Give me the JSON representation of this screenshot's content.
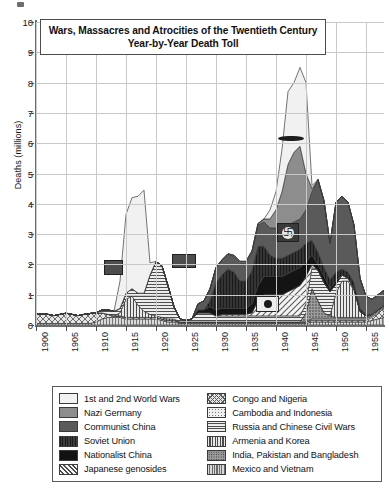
{
  "title_box": {
    "line1": "Wars, Massacres and Atrocities of the Twentieth Century",
    "line2": "Year-by-Year Death Toll"
  },
  "axis": {
    "ylabel": "Deaths (millions)",
    "yticks": [
      "0",
      "1",
      "2",
      "3",
      "4",
      "5",
      "6",
      "7",
      "8",
      "9",
      "10"
    ],
    "xticks": [
      "1900",
      "1905",
      "1910",
      "1915",
      "1920",
      "1925",
      "1930",
      "1935",
      "1940",
      "1945",
      "1950",
      "1955"
    ]
  },
  "legend": {
    "left": [
      {
        "label": "1st and 2nd World Wars",
        "fill": "f-white",
        "color": "#f2f2f2"
      },
      {
        "label": "Nazi Germany",
        "fill": "f-midgray",
        "color": "#8d8d8d"
      },
      {
        "label": "Communist China",
        "fill": "f-darkgray",
        "color": "#5a5a5a"
      },
      {
        "label": "Soviet Union",
        "fill": "f-soviet",
        "color": "#333333"
      },
      {
        "label": "Nationalist China",
        "fill": "f-black",
        "color": "#121212"
      },
      {
        "label": "Japanese genosides",
        "fill": "f-jap",
        "color": "#f4f4f4"
      }
    ],
    "right": [
      {
        "label": "Congo and Nigeria",
        "fill": "f-congo",
        "color": "#e4e4e4"
      },
      {
        "label": "Cambodia and Indonesia",
        "fill": "f-cambodia",
        "color": "#f0f0f0"
      },
      {
        "label": "Russia and Chinese Civil Wars",
        "fill": "f-russia",
        "color": "#ededed"
      },
      {
        "label": "Armenia and Korea",
        "fill": "f-armenia",
        "color": "#e8e8e8"
      },
      {
        "label": "India, Pakistan and Bangladesh",
        "fill": "f-india",
        "color": "#9a9a9a"
      },
      {
        "label": "Mexico and Vietnam",
        "fill": "f-mexico",
        "color": "#d8d8d8"
      }
    ]
  },
  "insets": [
    {
      "name": "battleship-photo",
      "desc": "dark ship silhouette over World Wars band"
    },
    {
      "name": "swastika-flag-photo",
      "desc": "swastika emblem over Nazi Germany band"
    },
    {
      "name": "rising-sun-flag-photo",
      "desc": "flag emblem over Japanese genosides band"
    },
    {
      "name": "archive-photo-small",
      "desc": "small photo over Soviet Union band"
    },
    {
      "name": "archive-photo-small-2",
      "desc": "small photo over Nationalist China band"
    }
  ],
  "chart_data": {
    "type": "area",
    "stacked": true,
    "xlabel": "",
    "ylabel": "Deaths (millions)",
    "xlim": [
      1900,
      1958
    ],
    "ylim": [
      0,
      10
    ],
    "grid": true,
    "legend_position": "below-plot",
    "x": [
      1900,
      1901,
      1902,
      1903,
      1904,
      1905,
      1906,
      1907,
      1908,
      1909,
      1910,
      1911,
      1912,
      1913,
      1914,
      1915,
      1916,
      1917,
      1918,
      1919,
      1920,
      1921,
      1922,
      1923,
      1924,
      1925,
      1926,
      1927,
      1928,
      1929,
      1930,
      1931,
      1932,
      1933,
      1934,
      1935,
      1936,
      1937,
      1938,
      1939,
      1940,
      1941,
      1942,
      1943,
      1944,
      1945,
      1946,
      1947,
      1948,
      1949,
      1950,
      1951,
      1952,
      1953,
      1954,
      1955,
      1956,
      1957,
      1958
    ],
    "series": [
      {
        "name": "1st and 2nd World Wars",
        "fill": "#f2f2f2",
        "values": [
          0,
          0,
          0,
          0,
          0,
          0,
          0,
          0,
          0,
          0,
          0,
          0,
          0,
          0,
          0.9,
          2.6,
          3.0,
          3.2,
          3.4,
          0.4,
          0,
          0,
          0,
          0,
          0,
          0,
          0,
          0,
          0,
          0,
          0,
          0,
          0,
          0,
          0,
          0,
          0,
          0,
          0,
          0.3,
          0.6,
          1.4,
          2.4,
          2.3,
          2.6,
          3.0,
          0.1,
          0,
          0,
          0,
          0,
          0,
          0,
          0,
          0,
          0,
          0,
          0,
          0
        ]
      },
      {
        "name": "Nazi Germany",
        "fill": "#8d8d8d",
        "values": [
          0,
          0,
          0,
          0,
          0,
          0,
          0,
          0,
          0,
          0,
          0,
          0,
          0,
          0,
          0,
          0,
          0,
          0,
          0,
          0,
          0,
          0,
          0,
          0,
          0,
          0,
          0,
          0,
          0,
          0,
          0,
          0,
          0,
          0.05,
          0.05,
          0.05,
          0.05,
          0.05,
          0.1,
          0.3,
          0.6,
          1.2,
          2.0,
          2.3,
          2.4,
          1.2,
          0.1,
          0,
          0,
          0,
          0,
          0,
          0,
          0,
          0,
          0,
          0,
          0,
          0
        ]
      },
      {
        "name": "Communist China",
        "fill": "#5a5a5a",
        "values": [
          0,
          0,
          0,
          0,
          0,
          0,
          0,
          0,
          0,
          0,
          0,
          0,
          0,
          0,
          0,
          0,
          0,
          0,
          0,
          0,
          0,
          0,
          0,
          0,
          0,
          0,
          0,
          0.2,
          0.3,
          0.4,
          0.5,
          0.5,
          0.5,
          0.5,
          0.6,
          0.6,
          0.6,
          0.7,
          0.8,
          0.9,
          1.0,
          1.0,
          1.0,
          1.0,
          1.0,
          1.1,
          1.6,
          2.4,
          2.2,
          1.2,
          2.3,
          2.4,
          2.3,
          1.9,
          1.0,
          0.6,
          0.5,
          0.5,
          0.5
        ]
      },
      {
        "name": "Soviet Union",
        "fill": "#333333",
        "values": [
          0,
          0,
          0,
          0,
          0,
          0,
          0,
          0,
          0,
          0,
          0,
          0,
          0,
          0,
          0,
          0,
          0,
          0,
          0,
          0,
          0,
          0,
          0,
          0,
          0,
          0,
          0,
          0,
          0,
          0.2,
          0.9,
          1.1,
          1.3,
          1.2,
          0.9,
          0.9,
          1.1,
          1.3,
          1.0,
          0.7,
          0.6,
          0.6,
          0.6,
          0.6,
          0.6,
          0.6,
          0.5,
          0.4,
          0.3,
          0.3,
          0.3,
          0.2,
          0.2,
          0.2,
          0.1,
          0.05,
          0,
          0,
          0
        ]
      },
      {
        "name": "Nationalist China",
        "fill": "#121212",
        "values": [
          0,
          0,
          0,
          0,
          0,
          0,
          0,
          0,
          0,
          0,
          0,
          0,
          0,
          0,
          0,
          0,
          0,
          0,
          0,
          0,
          0,
          0,
          0,
          0,
          0,
          0,
          0,
          0.1,
          0.1,
          0.2,
          0.2,
          0.2,
          0.2,
          0.2,
          0.2,
          0.2,
          0.3,
          0.5,
          0.6,
          0.6,
          0.6,
          0.6,
          0.6,
          0.6,
          0.6,
          0.5,
          0.3,
          0.2,
          0.2,
          0.1,
          0.1,
          0,
          0,
          0,
          0,
          0,
          0,
          0,
          0
        ]
      },
      {
        "name": "Japanese genosides",
        "fill": "#f4f4f4",
        "values": [
          0,
          0,
          0,
          0,
          0,
          0,
          0,
          0,
          0,
          0,
          0,
          0,
          0,
          0,
          0,
          0,
          0,
          0,
          0,
          0,
          0,
          0,
          0,
          0,
          0,
          0,
          0,
          0,
          0,
          0,
          0,
          0.05,
          0.05,
          0.05,
          0.05,
          0.05,
          0.1,
          0.5,
          0.7,
          0.7,
          0.7,
          0.7,
          0.8,
          0.9,
          1.0,
          0.9,
          0.1,
          0,
          0,
          0,
          0,
          0,
          0,
          0,
          0,
          0,
          0,
          0,
          0
        ]
      },
      {
        "name": "Congo and Nigeria",
        "fill": "#e4e4e4",
        "values": [
          0.3,
          0.32,
          0.3,
          0.26,
          0.3,
          0.34,
          0.3,
          0.26,
          0.3,
          0.33,
          0.3,
          0.2,
          0.1,
          0.05,
          0.05,
          0.05,
          0.05,
          0.05,
          0.05,
          0.05,
          0.05,
          0.05,
          0.05,
          0.05,
          0.05,
          0.05,
          0.05,
          0.05,
          0.05,
          0.05,
          0.05,
          0.05,
          0.05,
          0.05,
          0.05,
          0.05,
          0.05,
          0.05,
          0.05,
          0.05,
          0.05,
          0.05,
          0.05,
          0.05,
          0.05,
          0.05,
          0.05,
          0.05,
          0.05,
          0.05,
          0.05,
          0.05,
          0.05,
          0.05,
          0.05,
          0.05,
          0.1,
          0.2,
          0.3
        ]
      },
      {
        "name": "Cambodia and Indonesia",
        "fill": "#f0f0f0",
        "values": [
          0,
          0,
          0,
          0,
          0,
          0,
          0,
          0,
          0,
          0,
          0,
          0,
          0,
          0,
          0,
          0,
          0,
          0,
          0,
          0,
          0,
          0,
          0,
          0,
          0,
          0,
          0,
          0,
          0,
          0,
          0,
          0,
          0,
          0,
          0,
          0,
          0,
          0,
          0,
          0,
          0,
          0,
          0,
          0,
          0,
          0,
          0.05,
          0.05,
          0.05,
          0.05,
          0.05,
          0.05,
          0.05,
          0.05,
          0.05,
          0.05,
          0.05,
          0.05,
          0.05
        ]
      },
      {
        "name": "Russia and Chinese Civil Wars",
        "fill": "#ededed",
        "values": [
          0,
          0,
          0,
          0,
          0,
          0,
          0,
          0,
          0,
          0,
          0,
          0.1,
          0.15,
          0.15,
          0.15,
          0.2,
          0.25,
          0.4,
          0.6,
          1.3,
          1.8,
          1.7,
          1.1,
          0.4,
          0.1,
          0.05,
          0.1,
          0.3,
          0.3,
          0.3,
          0.2,
          0.2,
          0.2,
          0.2,
          0.2,
          0.2,
          0.2,
          0.2,
          0.2,
          0.2,
          0.2,
          0.2,
          0.2,
          0.2,
          0.2,
          0.3,
          0.7,
          1.0,
          1.0,
          0.8,
          0.3,
          0.2,
          0.1,
          0.05,
          0,
          0,
          0,
          0,
          0
        ]
      },
      {
        "name": "Armenia and Korea",
        "fill": "#e8e8e8",
        "values": [
          0,
          0,
          0,
          0,
          0,
          0,
          0,
          0,
          0,
          0,
          0,
          0,
          0,
          0,
          0.1,
          0.6,
          0.7,
          0.4,
          0.2,
          0.1,
          0.05,
          0.05,
          0.05,
          0.05,
          0,
          0,
          0,
          0,
          0,
          0,
          0,
          0,
          0,
          0,
          0,
          0,
          0,
          0,
          0,
          0,
          0,
          0,
          0,
          0,
          0,
          0,
          0,
          0,
          0,
          0,
          0.8,
          1.2,
          1.2,
          0.9,
          0.2,
          0.05,
          0,
          0,
          0
        ]
      },
      {
        "name": "India, Pakistan and Bangladesh",
        "fill": "#9a9a9a",
        "values": [
          0,
          0,
          0,
          0,
          0,
          0,
          0,
          0,
          0,
          0,
          0,
          0,
          0,
          0,
          0,
          0,
          0,
          0,
          0,
          0,
          0,
          0,
          0,
          0,
          0,
          0,
          0,
          0,
          0,
          0,
          0,
          0,
          0,
          0,
          0,
          0,
          0,
          0,
          0,
          0,
          0,
          0,
          0,
          0,
          0,
          0.3,
          1.0,
          0.6,
          0.2,
          0.1,
          0.05,
          0.05,
          0.05,
          0.05,
          0.05,
          0.05,
          0.05,
          0.05,
          0.05
        ]
      },
      {
        "name": "Mexico and Vietnam",
        "fill": "#d8d8d8",
        "values": [
          0.05,
          0.05,
          0.05,
          0.05,
          0.05,
          0.05,
          0.05,
          0.05,
          0.05,
          0.05,
          0.1,
          0.2,
          0.25,
          0.25,
          0.25,
          0.2,
          0.2,
          0.2,
          0.2,
          0.2,
          0.2,
          0.15,
          0.1,
          0.1,
          0.05,
          0.05,
          0.05,
          0.05,
          0.05,
          0.05,
          0.05,
          0.05,
          0.05,
          0.05,
          0.05,
          0.05,
          0.05,
          0.05,
          0.05,
          0.05,
          0.05,
          0.05,
          0.05,
          0.05,
          0.05,
          0.05,
          0.1,
          0.1,
          0.1,
          0.1,
          0.1,
          0.1,
          0.1,
          0.1,
          0.1,
          0.1,
          0.15,
          0.2,
          0.25
        ]
      }
    ],
    "annotations": [
      {
        "text": "WWI peak ≈ 4.1 million (1918)",
        "x": 1918,
        "y": 4.1
      },
      {
        "text": "WWII peak ≈ 8.5 million (1945)",
        "x": 1945,
        "y": 8.5
      }
    ]
  }
}
